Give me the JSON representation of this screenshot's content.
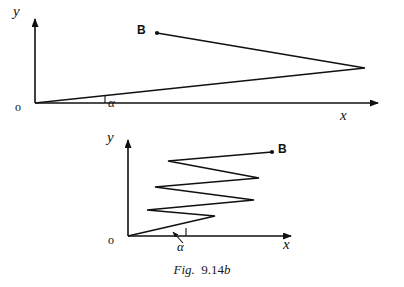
{
  "page": {
    "background_color": "#ffffff",
    "ink_color": "#111111",
    "width": 404,
    "height": 287
  },
  "caption": {
    "fig_word": "Fig.",
    "number": "9.14",
    "suffix": "b",
    "full_text": "Fig. 9.14b"
  },
  "figures": [
    {
      "id": "upper-figure",
      "name": "small-angle-trajectory",
      "axes": {
        "origin_label": "o",
        "x_axis_label": "x",
        "y_axis_label": "y",
        "angle_label": "α"
      },
      "points": [
        {
          "label": "B",
          "name": "point-b"
        }
      ],
      "geometry": {
        "origin": [
          35,
          103
        ],
        "x_axis_end": [
          385,
          103
        ],
        "y_axis_end": [
          35,
          12
        ],
        "trajectory": [
          [
            35,
            103
          ],
          [
            365,
            68
          ],
          [
            157,
            33
          ]
        ],
        "b_dot": [
          157,
          33
        ],
        "angle_tick": [
          [
            105,
            96
          ],
          [
            105,
            103
          ]
        ],
        "angle_label_pos": [
          109,
          98
        ],
        "x_label_pos": [
          341,
          108
        ],
        "y_label_pos": [
          17,
          9
        ],
        "origin_label_pos": [
          16,
          100
        ],
        "b_label_pos": [
          138,
          25
        ]
      }
    },
    {
      "id": "lower-figure",
      "name": "zigzag-trajectory",
      "axes": {
        "origin_label": "o",
        "x_axis_label": "x",
        "y_axis_label": "y",
        "angle_label": "α"
      },
      "points": [
        {
          "label": "B",
          "name": "point-b"
        }
      ],
      "geometry": {
        "origin": [
          128,
          236
        ],
        "x_axis_end": [
          297,
          236
        ],
        "y_axis_end": [
          128,
          134
        ],
        "zigzag": [
          [
            128,
            236
          ],
          [
            215,
            216
          ],
          [
            147,
            210
          ],
          [
            254,
            200
          ],
          [
            155,
            187
          ],
          [
            259,
            178
          ],
          [
            168,
            161
          ],
          [
            272,
            152
          ]
        ],
        "b_dot": [
          272,
          152
        ],
        "angle_tick": [
          [
            186,
            228
          ],
          [
            186,
            236
          ]
        ],
        "angle_pointer": [
          [
            183,
            240
          ],
          [
            172,
            231
          ]
        ],
        "angle_label_pos": [
          178,
          241
        ],
        "x_label_pos": [
          284,
          238
        ],
        "y_label_pos": [
          110,
          133
        ],
        "origin_label_pos": [
          109,
          233
        ],
        "b_label_pos": [
          278,
          144
        ]
      }
    }
  ]
}
